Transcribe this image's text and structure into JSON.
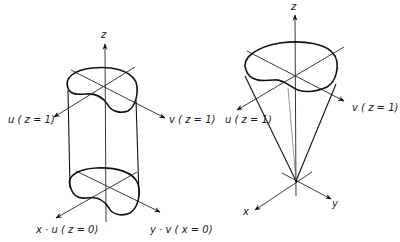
{
  "figure": {
    "panels": [
      {
        "name": "cylinder",
        "labels": {
          "z_axis": "z",
          "u_top": "u ( z = 1)",
          "v_top": "v ( z = 1)",
          "x_bottom": "x · u ( z = 0)",
          "y_bottom": "y · v ( x = 0)"
        }
      },
      {
        "name": "cone",
        "labels": {
          "z_axis": "z",
          "u_top": "u ( z = 1)",
          "v_top": "v ( z = 1)",
          "x_axis": "x",
          "y_axis": "y"
        }
      }
    ],
    "colors": {
      "ink": "#111111",
      "background": "#ffffff"
    }
  }
}
